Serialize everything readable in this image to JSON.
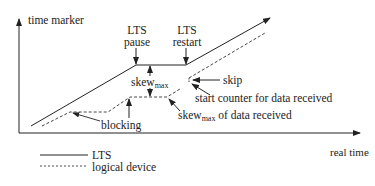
{
  "axes": {
    "y_label": "time marker",
    "x_label": "real time"
  },
  "annotations": {
    "lts_pause_l1": "LTS",
    "lts_pause_l2": "pause",
    "lts_restart_l1": "LTS",
    "lts_restart_l2": "restart",
    "skew_max_base": "skew",
    "skew_max_sub": "max",
    "skip": "skip",
    "start_counter": "start counter for data received",
    "skew_data_base": "skew",
    "skew_data_sub": "max",
    "skew_data_rest": " of data received",
    "blocking": "blocking"
  },
  "legend": {
    "items": [
      {
        "label": "LTS",
        "style": "solid"
      },
      {
        "label": "logical device",
        "style": "dashed"
      }
    ]
  },
  "colors": {
    "line": "#222222",
    "background": "#ffffff"
  }
}
